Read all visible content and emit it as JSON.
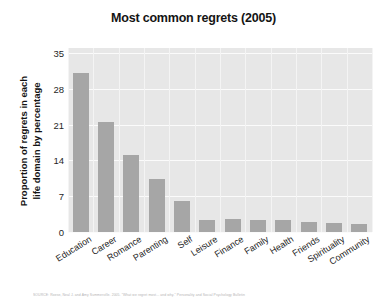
{
  "chart_data": {
    "type": "bar",
    "title": "Most common regrets (2005)",
    "xlabel": "",
    "ylabel": "Proportion of regrets in each life domain by percentage",
    "ylabel_lines": [
      "Proportion of regrets in each",
      "life domain by percentage"
    ],
    "categories": [
      "Education",
      "Career",
      "Romance",
      "Parenting",
      "Self",
      "Leisure",
      "Finance",
      "Family",
      "Health",
      "Friends",
      "Spirituality",
      "Community"
    ],
    "values": [
      31.2,
      21.6,
      15.1,
      10.3,
      6.0,
      2.4,
      2.5,
      2.4,
      2.4,
      1.9,
      1.7,
      1.6
    ],
    "ylim": [
      0,
      36
    ],
    "yticks": [
      0,
      7,
      14,
      21,
      28,
      35
    ],
    "ytick_labels": [
      "0",
      "7",
      "14",
      "21",
      "28",
      "35"
    ],
    "grid": true,
    "legend": false,
    "bar_color": "#a6a6a6",
    "plot_background": "#e7e7e7",
    "gridline_color": "#fbfbfb",
    "page_background": "#ffffff"
  },
  "footer": {
    "source_text": "SOURCE: Roese, Neal J. and Amy Summerville. 2005. \"What we regret most... and why.\" Personality and Social Psychology Bulletin"
  }
}
